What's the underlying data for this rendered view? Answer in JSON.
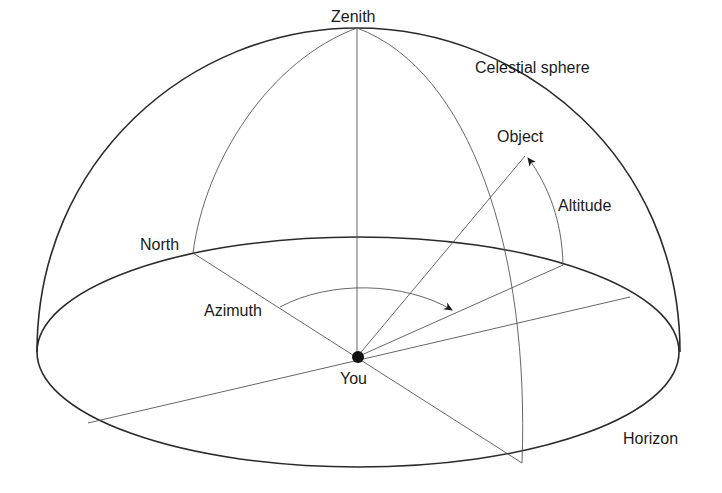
{
  "diagram": {
    "labels": {
      "zenith": "Zenith",
      "celestial_sphere": "Celestial sphere",
      "object": "Object",
      "altitude": "Altitude",
      "north": "North",
      "azimuth": "Azimuth",
      "you": "You",
      "horizon": "Horizon"
    },
    "colors": {
      "line": "#2a2a2a",
      "thin_line": "#555555",
      "text": "#1a1a1a",
      "background": "#ffffff"
    }
  }
}
